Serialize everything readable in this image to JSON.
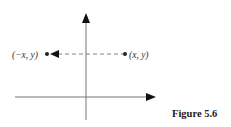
{
  "figure": {
    "caption": "Figure 5.6",
    "points": [
      {
        "label": "(x, y)",
        "role": "original"
      },
      {
        "label": "(−x, y)",
        "role": "reflected"
      }
    ],
    "axes": {
      "x_arrow": "right",
      "y_arrow": "up"
    },
    "reflection_line": {
      "style": "dashed",
      "direction": "right-to-left"
    }
  },
  "colors": {
    "line": "#555555",
    "arrow": "#111111",
    "text": "#333333"
  }
}
